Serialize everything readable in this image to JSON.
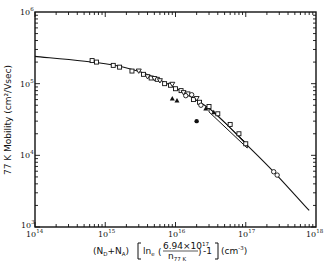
{
  "chart_data": {
    "type": "scatter",
    "title": "",
    "xlabel": "(N_D+N_A) [ln_e(6.94×10^17 / n_77 K) - 1] (cm^-3)",
    "ylabel": "77 K Mobility (cm^2/Vsec)",
    "xscale": "log",
    "yscale": "log",
    "xlim": [
      100000000000000.0,
      1e+18
    ],
    "ylim": [
      1000.0,
      1000000.0
    ],
    "x_tick_labels": [
      "10^14",
      "10^15",
      "10^16",
      "10^17",
      "10^18"
    ],
    "y_tick_labels": [
      "10^3",
      "10^4",
      "10^5",
      "10^6"
    ],
    "grid": false,
    "legend": null,
    "series": [
      {
        "name": "theory-curve",
        "kind": "line",
        "x": [
          100000000000000.0,
          1000000000000000.0,
          3200000000000000.0,
          1e+16,
          3.2e+16,
          1e+17,
          2.5e+17,
          8e+17
        ],
        "y": [
          240000,
          190000,
          145000,
          87000,
          43000,
          14500,
          5900,
          1700
        ]
      },
      {
        "name": "open-squares",
        "kind": "marker",
        "marker": "square-open",
        "x": [
          650000000000000.0,
          750000000000000.0,
          1300000000000000.0,
          1600000000000000.0,
          2400000000000000.0,
          3500000000000000.0,
          4500000000000000.0,
          5500000000000000.0,
          7000000000000000.0,
          8500000000000000.0,
          1e+16,
          1.2e+16,
          1.5e+16,
          1.8e+16,
          2.2e+16,
          3e+16,
          4e+16,
          6e+16,
          8e+16,
          1e+17
        ],
        "y": [
          210000,
          200000,
          180000,
          170000,
          150000,
          135000,
          120000,
          115000,
          100000,
          95000,
          85000,
          80000,
          72000,
          60000,
          55000,
          48000,
          38000,
          27000,
          20000,
          14500
        ]
      },
      {
        "name": "open-triangles-down",
        "kind": "marker",
        "marker": "triangle-down-open",
        "x": [
          3000000000000000.0,
          4000000000000000.0,
          5000000000000000.0,
          6000000000000000.0,
          9000000000000000.0,
          1.3e+16,
          2e+16
        ],
        "y": [
          150000,
          125000,
          118000,
          110000,
          98000,
          75000,
          62000
        ]
      },
      {
        "name": "open-circles",
        "kind": "marker",
        "marker": "circle-open",
        "x": [
          1.4e+16,
          1.7e+16,
          2.3e+16,
          2.5e+17,
          2.8e+17
        ],
        "y": [
          68000,
          70000,
          50000,
          5900,
          5300
        ]
      },
      {
        "name": "filled-triangles",
        "kind": "marker",
        "marker": "triangle-up-filled",
        "x": [
          9000000000000000.0,
          1.05e+16,
          2.7e+16,
          3.5e+16
        ],
        "y": [
          62000,
          58000,
          45000,
          40000
        ]
      },
      {
        "name": "filled-circle",
        "kind": "marker",
        "marker": "circle-filled",
        "x": [
          2e+16
        ],
        "y": [
          30000
        ]
      }
    ],
    "annotations": [
      {
        "text": "band of data",
        "x_range": [
          3e+16,
          1e+17
        ],
        "note": "narrow elongated band along curve"
      }
    ]
  },
  "axes": {
    "ylabel": "77  K Mobility (cm²/Vsec)",
    "xlabel_parts": {
      "prefix": "(N",
      "sub_d": "D",
      "plus": "+N",
      "sub_a": "A",
      "close": ")",
      "ln": "ln",
      "sub_e": "e",
      "numer": "6.94×10",
      "numer_exp": "17",
      "denom": "n",
      "denom_sub": "77  K",
      "tail": "-1",
      "units": "(cm",
      "units_exp": "-3",
      "units_close": ")"
    },
    "x_ticks": [
      {
        "base": "10",
        "exp": "14"
      },
      {
        "base": "10",
        "exp": "15"
      },
      {
        "base": "10",
        "exp": "16"
      },
      {
        "base": "10",
        "exp": "17"
      },
      {
        "base": "10",
        "exp": "18"
      }
    ],
    "y_ticks": [
      {
        "base": "10",
        "exp": "3"
      },
      {
        "base": "10",
        "exp": "4"
      },
      {
        "base": "10",
        "exp": "5"
      },
      {
        "base": "10",
        "exp": "6"
      }
    ]
  }
}
